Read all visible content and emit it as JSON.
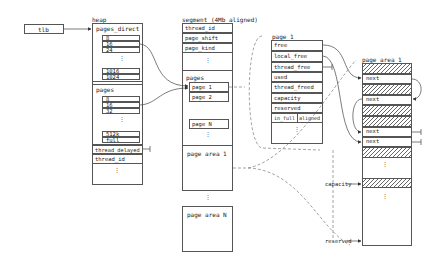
{
  "tlb": {
    "label": "tlb"
  },
  "heap": {
    "title": "heap",
    "pages_direct": {
      "label": "pages_direct",
      "entries": [
        "8",
        "16",
        "24",
        "1016",
        "1024"
      ]
    },
    "pages": {
      "label": "pages",
      "entries": [
        "8",
        "16",
        "32",
        "512k",
        "full"
      ]
    },
    "thread_delayed": "thread_delayed",
    "thread_id": "thread_id",
    "ellipsis": "⋮"
  },
  "segment": {
    "title": "segment (4Mb aligned)",
    "fields": [
      "thread_id",
      "page_shift",
      "page_kind"
    ],
    "pages_label": "pages",
    "page_entries": [
      "page 1",
      "page 2"
    ],
    "page_last": "page N",
    "page_area_1": "page area 1",
    "page_area_n": "page area N"
  },
  "page1": {
    "title": "page 1",
    "fields": [
      "free",
      "local_free",
      "thread_free",
      "used",
      "thread_freed",
      "capacity",
      "reserved"
    ],
    "in_full": "in_full",
    "aligned": "aligned"
  },
  "page_area": {
    "title": "page area 1",
    "next_label": "next",
    "capacity_label": "capacity",
    "reserved_label": "reserved"
  }
}
